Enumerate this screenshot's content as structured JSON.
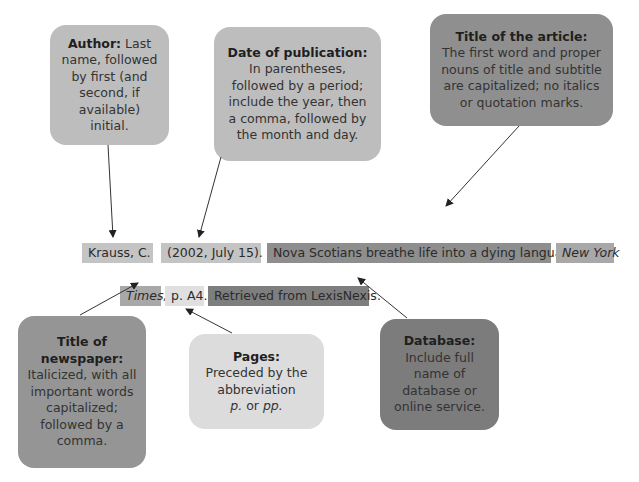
{
  "callouts": {
    "author": {
      "heading": "Author:",
      "text": "Last name, followed by first (and second, if available) initial."
    },
    "date": {
      "heading": "Date of publication:",
      "text": "In parentheses, followed by a period; include the year, then a comma, followed by the month and day."
    },
    "article_title": {
      "heading": "Title of the article:",
      "text": "The first word and proper nouns of title and subtitle are capitalized; no italics or quotation marks."
    },
    "newspaper": {
      "heading": "Title of newspaper:",
      "text": "Italicized, with all important words capitalized; followed by a comma."
    },
    "pages": {
      "heading": "Pages:",
      "text_pre": "Preceded by the abbreviation",
      "abbr1": "p.",
      "or": "or",
      "abbr2": "pp."
    },
    "database": {
      "heading": "Database:",
      "text": "Include full name of database or online service."
    }
  },
  "citation": {
    "line1": {
      "author": "Krauss, C.",
      "date": "(2002, July 15).",
      "title": "Nova Scotians breathe life into a dying language.",
      "newspaper_part1": "New York"
    },
    "line2": {
      "newspaper_part2": "Times,",
      "pages": "p. A4.",
      "retrieval": "Retrieved from LexisNexis."
    }
  }
}
